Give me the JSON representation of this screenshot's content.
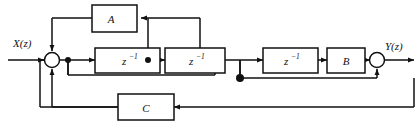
{
  "diagram": {
    "input_label": "X(z)",
    "output_label": "Y(z)",
    "blocks": [
      {
        "id": "A",
        "label": "A",
        "label_main": "A",
        "label_sup": ""
      },
      {
        "id": "D1",
        "label": "z-1",
        "label_main": "z",
        "label_sup": "−1"
      },
      {
        "id": "D2",
        "label": "z-1",
        "label_main": "z",
        "label_sup": "−1"
      },
      {
        "id": "D3",
        "label": "z-1",
        "label_main": "z",
        "label_sup": "−1"
      },
      {
        "id": "B",
        "label": "B",
        "label_main": "B",
        "label_sup": ""
      },
      {
        "id": "C",
        "label": "C",
        "label_main": "C",
        "label_sup": ""
      }
    ],
    "summing_junctions": [
      "sum-left",
      "sum-right"
    ],
    "nodes": [
      "node-after-sum",
      "node-between-delays",
      "node-output-tap"
    ],
    "colors": {
      "line": "#111111",
      "block_fill": "#ffffff",
      "block_stroke": "#111111",
      "background": "#ffffff"
    }
  }
}
